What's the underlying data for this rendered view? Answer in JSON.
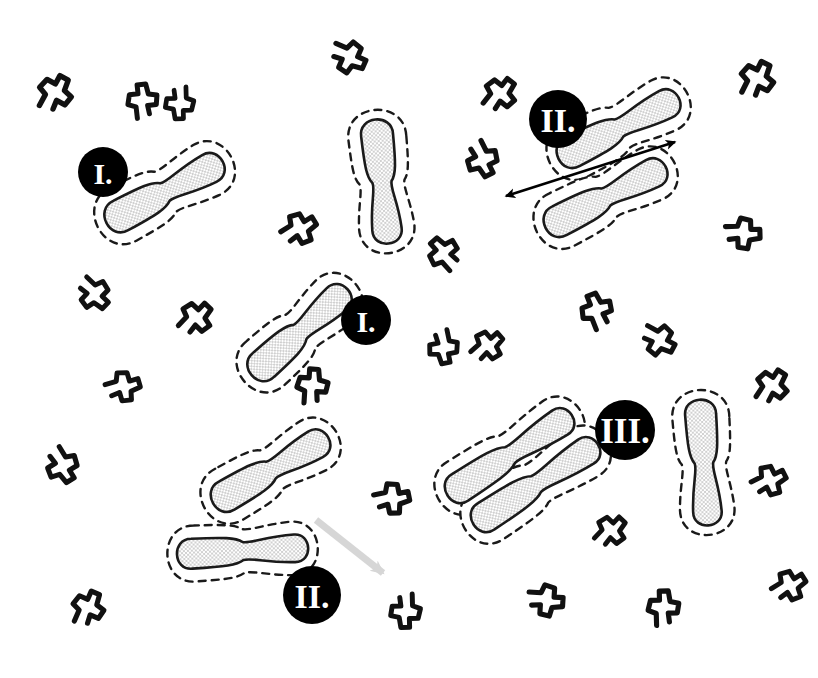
{
  "figure": {
    "background_color": "#ffffff",
    "width": 818,
    "height": 678,
    "colors": {
      "particle_outline": "#1a1a1a",
      "particle_fill": "#ffffff",
      "stipple_dot": "#8c8c8c",
      "depletion_zone_dash": "#1a1a1a",
      "polymer_chain": "#111111",
      "badge_fill": "#000000",
      "badge_label": "#ffffff",
      "arrow_black": "#000000",
      "arrow_gray": "#d6d6d6"
    }
  },
  "legend_stages": [
    {
      "id": "I",
      "label": "I.",
      "meaning": "isolated particle with depletion zone"
    },
    {
      "id": "II",
      "label": "II.",
      "meaning": "two particles approach and slide into alignment"
    },
    {
      "id": "III",
      "label": "III.",
      "meaning": "particles fully aligned, depletion zones merged"
    }
  ],
  "badges": [
    {
      "name": "badge-stage-1-upper-left",
      "label": "I.",
      "cx": 103,
      "cy": 172,
      "r": 25
    },
    {
      "name": "badge-stage-1-middle",
      "label": "I.",
      "cx": 366,
      "cy": 320,
      "r": 25
    },
    {
      "name": "badge-stage-2-upper-right",
      "label": "II.",
      "cx": 558,
      "cy": 119,
      "r": 29
    },
    {
      "name": "badge-stage-2-lower-left",
      "label": "II.",
      "cx": 312,
      "cy": 595,
      "r": 29
    },
    {
      "name": "badge-stage-3-lower-right",
      "label": "III.",
      "cx": 625,
      "cy": 430,
      "r": 30
    }
  ],
  "particles": [
    {
      "name": "particle-stage1-upper-left",
      "cx": 165,
      "cy": 192,
      "len": 108,
      "w": 33,
      "rot": -28,
      "group": "I-upper-left"
    },
    {
      "name": "particle-free-top-center",
      "cx": 382,
      "cy": 182,
      "len": 102,
      "w": 32,
      "rot": 84,
      "group": "free-top-center"
    },
    {
      "name": "particle-stage1-middle",
      "cx": 300,
      "cy": 332,
      "len": 106,
      "w": 32,
      "rot": -42,
      "group": "I-middle"
    },
    {
      "name": "particle-stage2-ur-top",
      "cx": 619,
      "cy": 128,
      "len": 112,
      "w": 32,
      "rot": -27,
      "group": "II-upper-right"
    },
    {
      "name": "particle-stage2-ur-bottom",
      "cx": 606,
      "cy": 197,
      "len": 112,
      "w": 32,
      "rot": -27,
      "group": "II-upper-right"
    },
    {
      "name": "particle-stage2-ll-top",
      "cx": 271,
      "cy": 470,
      "len": 110,
      "w": 32,
      "rot": -30,
      "group": "II-lower-left"
    },
    {
      "name": "particle-stage2-ll-bottom",
      "cx": 243,
      "cy": 551,
      "len": 110,
      "w": 30,
      "rot": -3,
      "group": "II-lower-left"
    },
    {
      "name": "particle-stage3-upper",
      "cx": 510,
      "cy": 455,
      "len": 126,
      "w": 31,
      "rot": -33,
      "group": "III-aggregate"
    },
    {
      "name": "particle-stage3-lower",
      "cx": 536,
      "cy": 484,
      "len": 126,
      "w": 31,
      "rot": -33,
      "group": "III-aggregate"
    },
    {
      "name": "particle-free-right",
      "cx": 704,
      "cy": 463,
      "len": 104,
      "w": 31,
      "rot": 86,
      "group": "free-right"
    }
  ],
  "arrows": [
    {
      "name": "alignment-arrow-stage-2",
      "style": "double-headed",
      "color": "#000000",
      "x1": 506,
      "y1": 196,
      "x2": 675,
      "y2": 142
    },
    {
      "name": "approach-arrow-stage-2-gray",
      "style": "single-headed",
      "color": "#d6d6d6",
      "x1": 316,
      "y1": 520,
      "x2": 383,
      "y2": 573
    }
  ],
  "polymer_chains": [
    {
      "name": "polymer-chain",
      "cx": 55,
      "cy": 92,
      "rot": 10,
      "s": 1.0
    },
    {
      "name": "polymer-chain",
      "cx": 142,
      "cy": 100,
      "rot": -25,
      "s": 0.92
    },
    {
      "name": "polymer-chain",
      "cx": 180,
      "cy": 104,
      "rot": 160,
      "s": 0.88
    },
    {
      "name": "polymer-chain",
      "cx": 350,
      "cy": 57,
      "rot": 95,
      "s": 0.95
    },
    {
      "name": "polymer-chain",
      "cx": 300,
      "cy": 228,
      "rot": 40,
      "s": 0.95
    },
    {
      "name": "polymer-chain",
      "cx": 443,
      "cy": 253,
      "rot": -60,
      "s": 0.92
    },
    {
      "name": "polymer-chain",
      "cx": 500,
      "cy": 93,
      "rot": 20,
      "s": 0.95
    },
    {
      "name": "polymer-chain",
      "cx": 483,
      "cy": 160,
      "rot": 135,
      "s": 0.95
    },
    {
      "name": "polymer-chain",
      "cx": 757,
      "cy": 78,
      "rot": 8,
      "s": 1.0
    },
    {
      "name": "polymer-chain",
      "cx": 744,
      "cy": 233,
      "rot": 70,
      "s": 0.95
    },
    {
      "name": "polymer-chain",
      "cx": 95,
      "cy": 294,
      "rot": 115,
      "s": 0.92
    },
    {
      "name": "polymer-chain",
      "cx": 196,
      "cy": 317,
      "rot": 25,
      "s": 0.95
    },
    {
      "name": "polymer-chain",
      "cx": 124,
      "cy": 386,
      "rot": 55,
      "s": 0.92
    },
    {
      "name": "polymer-chain",
      "cx": 312,
      "cy": 385,
      "rot": -15,
      "s": 0.95
    },
    {
      "name": "polymer-chain",
      "cx": 444,
      "cy": 348,
      "rot": 150,
      "s": 0.9
    },
    {
      "name": "polymer-chain",
      "cx": 488,
      "cy": 345,
      "rot": 30,
      "s": 0.9
    },
    {
      "name": "polymer-chain",
      "cx": 596,
      "cy": 310,
      "rot": -40,
      "s": 0.95
    },
    {
      "name": "polymer-chain",
      "cx": 660,
      "cy": 340,
      "rot": 100,
      "s": 0.92
    },
    {
      "name": "polymer-chain",
      "cx": 772,
      "cy": 385,
      "rot": 15,
      "s": 0.95
    },
    {
      "name": "polymer-chain",
      "cx": 63,
      "cy": 466,
      "rot": 130,
      "s": 0.95
    },
    {
      "name": "polymer-chain",
      "cx": 393,
      "cy": 498,
      "rot": 60,
      "s": 0.95
    },
    {
      "name": "polymer-chain",
      "cx": 770,
      "cy": 480,
      "rot": 45,
      "s": 0.92
    },
    {
      "name": "polymer-chain",
      "cx": 611,
      "cy": 530,
      "rot": 25,
      "s": 0.9
    },
    {
      "name": "polymer-chain",
      "cx": 88,
      "cy": 607,
      "rot": 5,
      "s": 0.95
    },
    {
      "name": "polymer-chain",
      "cx": 406,
      "cy": 612,
      "rot": 160,
      "s": 0.92
    },
    {
      "name": "polymer-chain",
      "cx": 547,
      "cy": 600,
      "rot": 75,
      "s": 0.95
    },
    {
      "name": "polymer-chain",
      "cx": 663,
      "cy": 607,
      "rot": -20,
      "s": 0.95
    },
    {
      "name": "polymer-chain",
      "cx": 790,
      "cy": 585,
      "rot": 40,
      "s": 0.92
    }
  ]
}
